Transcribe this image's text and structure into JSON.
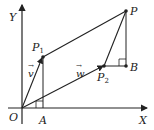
{
  "diagram": {
    "axes": {
      "x_label": "X",
      "y_label": "Y",
      "origin_label": "O"
    },
    "points": {
      "P": "P",
      "P1": {
        "base": "P",
        "sub": "1"
      },
      "P2": {
        "base": "P",
        "sub": "2"
      },
      "A": "A",
      "B": "B"
    },
    "vectors": {
      "v": "v",
      "w": "w",
      "arrow": "→"
    },
    "colors": {
      "stroke": "#222222",
      "background": "#ffffff"
    }
  }
}
